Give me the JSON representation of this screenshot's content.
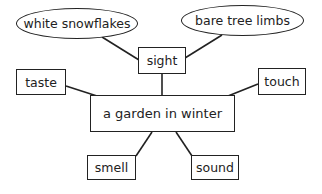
{
  "diagram": {
    "type": "web-organizer",
    "center": {
      "label": "a garden in winter"
    },
    "senses": [
      {
        "id": "sight",
        "label": "sight"
      },
      {
        "id": "taste",
        "label": "taste"
      },
      {
        "id": "touch",
        "label": "touch"
      },
      {
        "id": "smell",
        "label": "smell"
      },
      {
        "id": "sound",
        "label": "sound"
      }
    ],
    "details": [
      {
        "parent": "sight",
        "label": "white snowflakes"
      },
      {
        "parent": "sight",
        "label": "bare tree limbs"
      }
    ],
    "colors": {
      "stroke": "#222222",
      "background": "#ffffff"
    }
  }
}
